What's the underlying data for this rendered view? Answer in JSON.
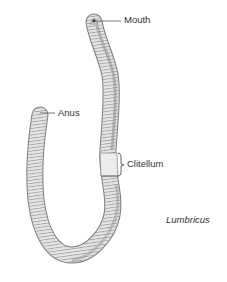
{
  "figure": {
    "species_label": "Lumbricus",
    "labels": {
      "mouth": "Mouth",
      "anus": "Anus",
      "clitellum": "Clitellum"
    },
    "colors": {
      "body_fill": "#e6e6e6",
      "body_shade": "#9a9a9a",
      "segment_line": "#7a7a7a",
      "outline": "#6e6e6e",
      "clitellum_fill": "#efefef",
      "leader_line": "#555555",
      "text": "#333333"
    }
  }
}
